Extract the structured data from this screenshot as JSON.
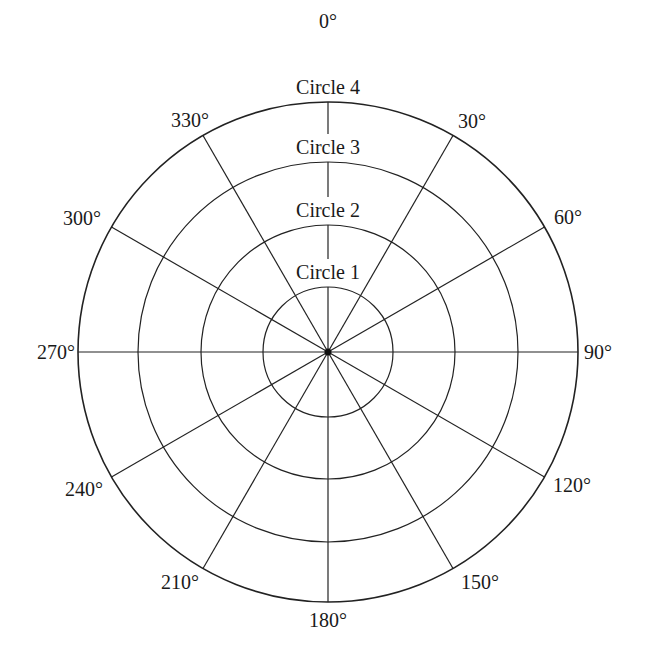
{
  "diagram": {
    "type": "polar-grid",
    "center": {
      "x": 328,
      "y": 352
    },
    "line_color": "#222222",
    "circles": [
      {
        "label": "Circle 1",
        "radius": 65
      },
      {
        "label": "Circle 2",
        "radius": 127
      },
      {
        "label": "Circle 3",
        "radius": 190
      },
      {
        "label": "Circle 4",
        "radius": 250
      }
    ],
    "angles": [
      {
        "deg": 0,
        "label": "0°"
      },
      {
        "deg": 30,
        "label": "30°"
      },
      {
        "deg": 60,
        "label": "60°"
      },
      {
        "deg": 90,
        "label": "90°"
      },
      {
        "deg": 120,
        "label": "120°"
      },
      {
        "deg": 150,
        "label": "150°"
      },
      {
        "deg": 180,
        "label": "180°"
      },
      {
        "deg": 210,
        "label": "210°"
      },
      {
        "deg": 240,
        "label": "240°"
      },
      {
        "deg": 270,
        "label": "270°"
      },
      {
        "deg": 300,
        "label": "300°"
      },
      {
        "deg": 330,
        "label": "330°"
      }
    ]
  }
}
